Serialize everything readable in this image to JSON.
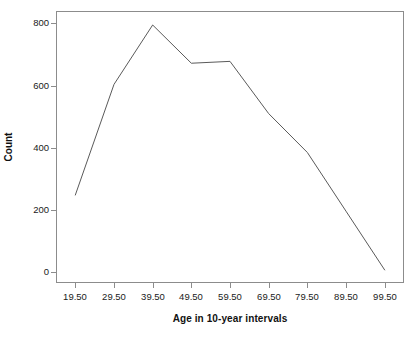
{
  "chart_data": {
    "type": "line",
    "title": "",
    "subtitle": "",
    "xlabel": "Age in 10-year intervals",
    "ylabel": "Count",
    "x": [
      19.5,
      29.5,
      39.5,
      49.5,
      59.5,
      69.5,
      79.5,
      89.5,
      99.5
    ],
    "xtick_labels": [
      "19.50",
      "29.50",
      "39.50",
      "49.50",
      "59.50",
      "69.50",
      "79.50",
      "89.50",
      "99.50"
    ],
    "ytick_labels": [
      "0",
      "200",
      "400",
      "600",
      "800"
    ],
    "yticks": [
      0,
      200,
      400,
      600,
      800
    ],
    "values": [
      248,
      604,
      795,
      672,
      678,
      510,
      385,
      196,
      7
    ],
    "series": [
      {
        "name": "Count",
        "values": [
          248,
          604,
          795,
          672,
          678,
          510,
          385,
          196,
          7
        ]
      }
    ],
    "xlim": [
      14.5,
      104.5
    ],
    "ylim": [
      -35,
      840
    ],
    "grid": false,
    "legend": false,
    "legend_position": "none",
    "line_color": "#5a5a5a",
    "frame_color": "#8c8c8c",
    "background_color": "#ffffff",
    "annotations": []
  }
}
